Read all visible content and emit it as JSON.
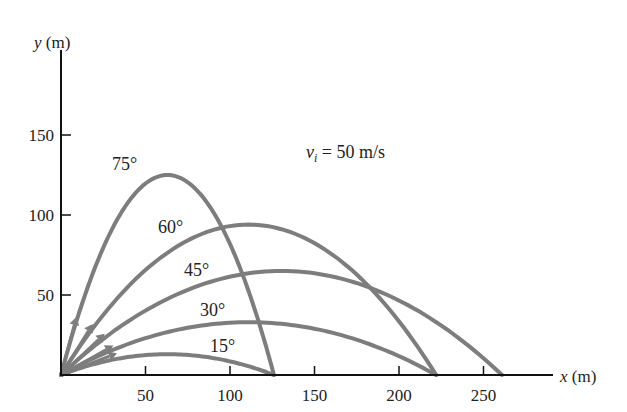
{
  "chart_data": {
    "type": "line",
    "title": "",
    "annotation": "v_i = 50 m/s",
    "annotation_parts": {
      "var": "v",
      "sub": "i",
      "rest": " = 50 m/s"
    },
    "xlabel": "x (m)",
    "ylabel": "y (m)",
    "xlim": [
      0,
      290
    ],
    "ylim": [
      0,
      190
    ],
    "x_ticks": [
      50,
      100,
      150,
      200,
      250
    ],
    "y_ticks": [
      50,
      100,
      150
    ],
    "grid": false,
    "legend": "inline labels",
    "series": [
      {
        "name": "75°",
        "label": "75°",
        "range": 126,
        "max_height": 125
      },
      {
        "name": "60°",
        "label": "60°",
        "range": 222,
        "max_height": 94
      },
      {
        "name": "45°",
        "label": "45°",
        "range": 261,
        "max_height": 65
      },
      {
        "name": "30°",
        "label": "30°",
        "range": 222,
        "max_height": 33
      },
      {
        "name": "15°",
        "label": "15°",
        "range": 126,
        "max_height": 13
      }
    ]
  },
  "colors": {
    "curve": "#7d7d7d",
    "axis": "#111111",
    "text": "#222222"
  }
}
